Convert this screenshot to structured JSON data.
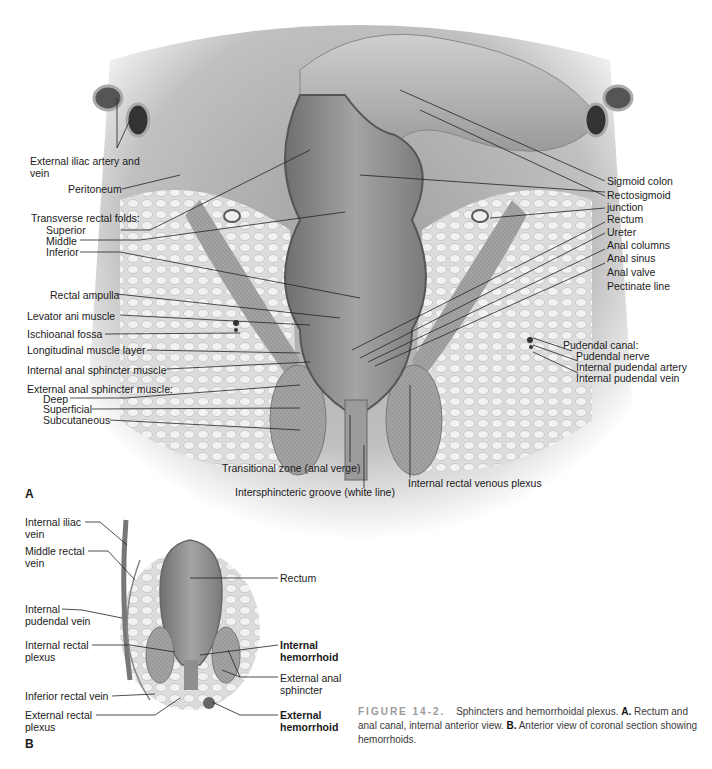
{
  "figure": {
    "number_label": "FIGURE 14-2.",
    "caption_lead": "Sphincters and hemorrhoidal plexus.",
    "caption_a_marker": "A.",
    "caption_a_text": "Rectum and anal canal, internal anterior view.",
    "caption_b_marker": "B.",
    "caption_b_text": "Anterior view of coronal section showing hemorrhoids."
  },
  "panel_a": {
    "letter": "A",
    "left_labels": {
      "external_iliac": "External iliac artery and vein",
      "peritoneum": "Peritoneum",
      "transverse_folds_heading": "Transverse rectal folds:",
      "superior": "Superior",
      "middle": "Middle",
      "inferior": "Inferior",
      "rectal_ampulla": "Rectal ampulla",
      "levator_ani": "Levator ani muscle",
      "ischioanal_fossa": "Ischioanal fossa",
      "longitudinal_layer": "Longitudinal muscle layer",
      "internal_sphincter": "Internal anal sphincter muscle",
      "external_sphincter_heading": "External anal sphincter muscle:",
      "deep": "Deep",
      "superficial": "Superficial",
      "subcutaneous": "Subcutaneous"
    },
    "right_labels": {
      "sigmoid_colon": "Sigmoid colon",
      "rectosigmoid": "Rectosigmoid junction",
      "rectum": "Rectum",
      "ureter": "Ureter",
      "anal_columns": "Anal columns",
      "anal_sinus": "Anal sinus",
      "anal_valve": "Anal valve",
      "pectinate_line": "Pectinate line",
      "pudendal_canal_heading": "Pudendal canal:",
      "pudendal_nerve": "Pudendal nerve",
      "internal_pudendal_artery": "Internal pudendal artery",
      "internal_pudendal_vein": "Internal pudendal vein"
    },
    "bottom_labels": {
      "transitional_zone": "Transitional zone (anal verge)",
      "intersphincteric_groove": "Intersphincteric groove (white line)",
      "internal_rectal_venous_plexus": "Internal rectal venous plexus"
    }
  },
  "panel_b": {
    "letter": "B",
    "left_labels": {
      "internal_iliac_vein": "Internal iliac vein",
      "middle_rectal_vein": "Middle rectal vein",
      "internal_pudendal_vein": "Internal pudendal vein",
      "internal_rectal_plexus": "Internal rectal plexus",
      "inferior_rectal_vein": "Inferior rectal vein",
      "external_rectal_plexus": "External rectal plexus"
    },
    "right_labels": {
      "rectum": "Rectum",
      "internal_hemorrhoid": "Internal hemorrhoid",
      "external_anal_sphincter": "External anal sphincter",
      "external_hemorrhoid": "External hemorrhoid"
    }
  },
  "colors": {
    "tissue_dark": "#8a8a8a",
    "tissue_mid": "#a9a9a9",
    "tissue_light": "#d4d4d4",
    "fat": "#e6e6e6",
    "leader": "#222222"
  }
}
